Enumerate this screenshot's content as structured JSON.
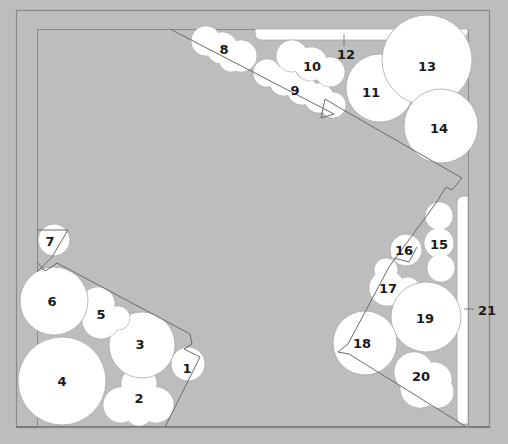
{
  "colors": {
    "background": "#bdbdbd",
    "plant_fill": "#ffffff",
    "plant_stroke": "#a8a8a8",
    "frame_line": "#8a8a8a",
    "path_line": "#6a6a6a",
    "label": "#1a1a1a"
  },
  "plants": [
    {
      "id": "1",
      "label": "1",
      "lx": 187,
      "ly": 368,
      "circles": [
        [
          188,
          364,
          17
        ]
      ]
    },
    {
      "id": "2",
      "label": "2",
      "lx": 139,
      "ly": 398,
      "circles": [
        [
          139,
          384,
          18
        ],
        [
          121,
          405,
          18
        ],
        [
          156,
          405,
          18
        ],
        [
          139,
          412,
          14
        ]
      ]
    },
    {
      "id": "3",
      "label": "3",
      "lx": 140,
      "ly": 344,
      "circles": [
        [
          142,
          345,
          33
        ]
      ]
    },
    {
      "id": "4",
      "label": "4",
      "lx": 62,
      "ly": 381,
      "circles": [
        [
          62,
          381,
          44
        ]
      ]
    },
    {
      "id": "5",
      "label": "5",
      "lx": 101,
      "ly": 314,
      "circles": [
        [
          98,
          304,
          17
        ],
        [
          101,
          320,
          19
        ],
        [
          118,
          318,
          12
        ]
      ]
    },
    {
      "id": "6",
      "label": "6",
      "lx": 52,
      "ly": 301,
      "circles": [
        [
          54,
          301,
          34
        ]
      ]
    },
    {
      "id": "7",
      "label": "7",
      "lx": 50,
      "ly": 241,
      "circles": [
        [
          54,
          240,
          16
        ]
      ]
    },
    {
      "id": "8",
      "label": "8",
      "lx": 224,
      "ly": 49,
      "circles": [
        [
          206,
          41,
          15
        ],
        [
          222,
          48,
          16
        ],
        [
          241,
          56,
          16
        ],
        [
          231,
          60,
          12
        ]
      ]
    },
    {
      "id": "9",
      "label": "9",
      "lx": 295,
      "ly": 90,
      "circles": [
        [
          267,
          73,
          14
        ],
        [
          284,
          81,
          15
        ],
        [
          302,
          90,
          15
        ],
        [
          319,
          98,
          15
        ],
        [
          333,
          105,
          13
        ]
      ]
    },
    {
      "id": "10",
      "label": "10",
      "lx": 312,
      "ly": 66,
      "circles": [
        [
          292,
          56,
          16
        ],
        [
          311,
          64,
          17
        ],
        [
          330,
          72,
          15
        ]
      ]
    },
    {
      "id": "11",
      "label": "11",
      "lx": 371,
      "ly": 92,
      "circles": [
        [
          380,
          88,
          34
        ]
      ]
    },
    {
      "id": "12",
      "label": "12",
      "lx": 346,
      "ly": 54,
      "circles": []
    },
    {
      "id": "13",
      "label": "13",
      "lx": 427,
      "ly": 66,
      "circles": [
        [
          427,
          60,
          45
        ]
      ]
    },
    {
      "id": "14",
      "label": "14",
      "lx": 439,
      "ly": 128,
      "circles": [
        [
          441,
          126,
          37
        ]
      ]
    },
    {
      "id": "15",
      "label": "15",
      "lx": 439,
      "ly": 244,
      "circles": [
        [
          439,
          216,
          14
        ],
        [
          439,
          243,
          15
        ],
        [
          441,
          268,
          14
        ]
      ]
    },
    {
      "id": "16",
      "label": "16",
      "lx": 404,
      "ly": 250,
      "circles": [
        [
          406,
          250,
          16
        ]
      ]
    },
    {
      "id": "17",
      "label": "17",
      "lx": 388,
      "ly": 288,
      "circles": [
        [
          386,
          270,
          12
        ],
        [
          387,
          288,
          18
        ],
        [
          408,
          289,
          12
        ]
      ]
    },
    {
      "id": "19",
      "label": "19",
      "lx": 425,
      "ly": 318,
      "circles": [
        [
          426,
          317,
          35
        ]
      ]
    },
    {
      "id": "18",
      "label": "18",
      "lx": 362,
      "ly": 343,
      "circles": [
        [
          365,
          343,
          32
        ]
      ]
    },
    {
      "id": "20",
      "label": "20",
      "lx": 421,
      "ly": 376,
      "circles": [
        [
          414,
          372,
          20
        ],
        [
          434,
          380,
          18
        ],
        [
          420,
          388,
          20
        ],
        [
          438,
          392,
          16
        ]
      ]
    },
    {
      "id": "21",
      "label": "21",
      "lx": 487,
      "ly": 310,
      "circles": []
    }
  ],
  "hedge_top": {
    "x": 255,
    "y": 29,
    "w": 213,
    "h": 11
  },
  "hedge_right": {
    "x": 457,
    "y": 196,
    "w": 11,
    "h": 228
  },
  "frames": {
    "outer": {
      "x": 16,
      "y": 10,
      "w": 473,
      "h": 417
    },
    "inner": {
      "x": 37,
      "y": 29,
      "w": 431,
      "h": 398
    }
  }
}
